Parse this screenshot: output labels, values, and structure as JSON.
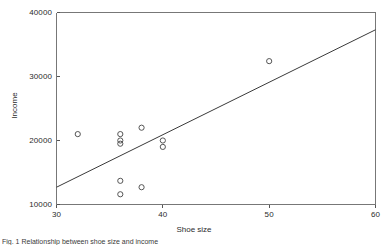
{
  "figure": {
    "caption": "Fig. 1 Relationship between shoe size and income",
    "background_color": "#ffffff",
    "line_color": "#3a3a3a",
    "marker_color": "#555555",
    "axis_color": "#777777"
  },
  "chart_data": {
    "type": "scatter",
    "title": "",
    "xlabel": "Shoe size",
    "ylabel": "Income",
    "xlim": [
      30,
      60
    ],
    "ylim": [
      10000,
      40000
    ],
    "xticks": [
      30,
      40,
      50,
      60
    ],
    "xtick_labels": [
      "30",
      "40",
      "50",
      "60"
    ],
    "yticks": [
      10000,
      20000,
      30000,
      40000
    ],
    "ytick_labels": [
      "10000",
      "20000",
      "30000",
      "40000"
    ],
    "grid": false,
    "legend": null,
    "marker": "open-circle",
    "points": [
      {
        "x": 32,
        "y": 21000
      },
      {
        "x": 36,
        "y": 21000
      },
      {
        "x": 36,
        "y": 20000
      },
      {
        "x": 36,
        "y": 19500
      },
      {
        "x": 36,
        "y": 13700
      },
      {
        "x": 36,
        "y": 11600
      },
      {
        "x": 38,
        "y": 22000
      },
      {
        "x": 38,
        "y": 12700
      },
      {
        "x": 40,
        "y": 20000
      },
      {
        "x": 40,
        "y": 19000
      },
      {
        "x": 50,
        "y": 32400
      }
    ],
    "trend_line": {
      "type": "linear-fit",
      "x_start": 30,
      "y_start": 12700,
      "x_end": 60,
      "y_end": 37300
    }
  }
}
